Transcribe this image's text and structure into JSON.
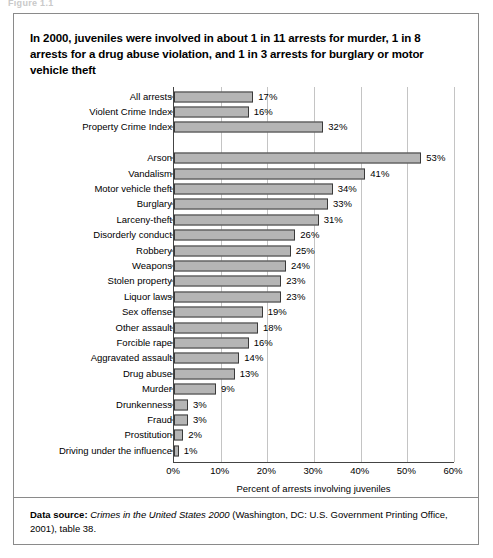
{
  "figure_caption": "Figure 1.1",
  "title": "In 2000, juveniles were involved in about 1 in 11 arrests for murder, 1 in 8 arrests for a drug abuse violation, and 1 in 3 arrests for burglary or motor vehicle theft",
  "source": {
    "label": "Data source:",
    "italic_title": "Crimes in the United States 2000",
    "rest": " (Washington, DC: U.S. Government Printing Office, 2001), table 38."
  },
  "chart_data": {
    "type": "bar",
    "orientation": "horizontal",
    "title": "In 2000, juveniles were involved in about 1 in 11 arrests for murder, 1 in 8 arrests for a drug abuse violation, and 1 in 3 arrests for burglary or motor vehicle theft",
    "xlabel": "Percent of arrests involving juveniles",
    "ylabel": "",
    "xlim": [
      0,
      60
    ],
    "xticks": [
      0,
      10,
      20,
      30,
      40,
      50,
      60
    ],
    "xtick_labels": [
      "0%",
      "10%",
      "20%",
      "30%",
      "40%",
      "50%",
      "60%"
    ],
    "grid": "vertical",
    "legend": "none",
    "bar_color": "#b5b5b5",
    "bar_edge_color": "#3a3a3a",
    "group_gap_after_index": 2,
    "categories": [
      "All arrests",
      "Violent Crime Index",
      "Property Crime Index",
      "Arson",
      "Vandalism",
      "Motor vehicle theft",
      "Burglary",
      "Larceny-theft",
      "Disorderly conduct",
      "Robbery",
      "Weapons",
      "Stolen property",
      "Liquor laws",
      "Sex offense",
      "Other assault",
      "Forcible rape",
      "Aggravated assault",
      "Drug abuse",
      "Murder",
      "Drunkenness",
      "Fraud",
      "Prostitution",
      "Driving under the influence"
    ],
    "values": [
      17,
      16,
      32,
      53,
      41,
      34,
      33,
      31,
      26,
      25,
      24,
      23,
      23,
      19,
      18,
      16,
      14,
      13,
      9,
      3,
      3,
      2,
      1
    ],
    "value_labels": [
      "17%",
      "16%",
      "32%",
      "53%",
      "41%",
      "34%",
      "33%",
      "31%",
      "26%",
      "25%",
      "24%",
      "23%",
      "23%",
      "19%",
      "18%",
      "16%",
      "14%",
      "13%",
      "9%",
      "3%",
      "3%",
      "2%",
      "1%"
    ]
  }
}
